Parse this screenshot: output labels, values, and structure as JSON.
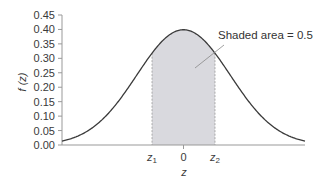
{
  "chart_data": {
    "type": "area",
    "title": "",
    "xlabel": "z",
    "ylabel": "f (z)",
    "ylim": [
      0,
      0.45
    ],
    "xlim": [
      -2.6,
      2.6
    ],
    "yticks": [
      "0.00",
      "0.05",
      "0.10",
      "0.15",
      "0.20",
      "0.25",
      "0.30",
      "0.35",
      "0.40",
      "0.45"
    ],
    "xticks": [
      {
        "label": "z",
        "sub": "1",
        "value": -0.674
      },
      {
        "label": "0",
        "sub": "",
        "value": 0
      },
      {
        "label": "z",
        "sub": "2",
        "value": 0.674
      }
    ],
    "series": [
      {
        "name": "standard normal pdf",
        "function": "f(z)=exp(-z^2/2)/sqrt(2*pi)",
        "peak": 0.399
      }
    ],
    "shaded_region": {
      "from": -0.674,
      "to": 0.674,
      "area": 0.5
    },
    "annotation": "Shaded area = 0.5",
    "grid": false,
    "colors": {
      "curve": "#3a3a3a",
      "shade": "#d9d9de",
      "axis": "#999999"
    }
  }
}
